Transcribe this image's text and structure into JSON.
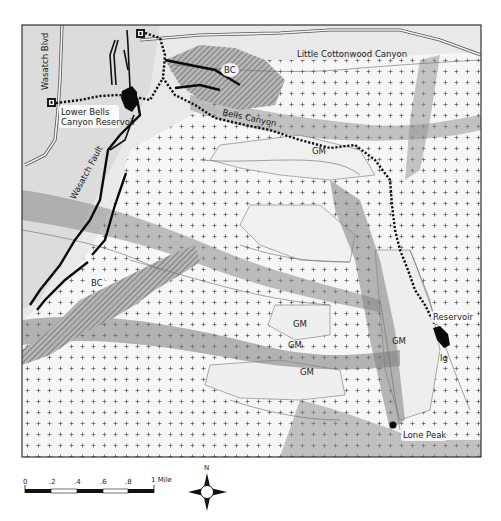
{
  "map": {
    "frame": {
      "x": 22,
      "y": 25,
      "width": 459,
      "height": 432
    },
    "colors": {
      "frame": "#333333",
      "hillshade_light": "#f2f2f2",
      "hillshade_mid": "#c8c8c8",
      "hillshade_dark": "#7a7a7a",
      "trail": "#111111",
      "fault": "#0a0a0a",
      "water": "#0a0a0a",
      "road": "#555555",
      "contact": "#666666",
      "hatch": "#444444"
    },
    "labels": {
      "wasatch_blvd": "Wasatch Blvd",
      "lower_reservoir_line1": "Lower Bells",
      "lower_reservoir_line2": "Canyon Reservoir",
      "little_cottonwood": "Little Cottonwood Canyon",
      "bells_canyon": "Bells Canyon",
      "wasatch_fault": "Wasatch Fault",
      "reservoir": "Reservoir",
      "lone_peak": "Lone Peak",
      "bc_north": "BC",
      "bc_south": "BC",
      "gm_1": "GM",
      "gm_2": "GM",
      "gm_3": "GM",
      "gm_4": "GM",
      "gm_5": "GM",
      "ig": "Ig"
    },
    "trailhead_icons": [
      {
        "name": "trailhead-north",
        "x": 141,
        "y": 34
      },
      {
        "name": "trailhead-west",
        "x": 51,
        "y": 103
      }
    ]
  },
  "scale_bar": {
    "ticks": [
      "0",
      ".2",
      ".4",
      ".6",
      ".8",
      "1 Mile"
    ],
    "unit": "Mile"
  },
  "north_arrow": {
    "label": "N"
  },
  "caption": {
    "text": "Geologic map of Bells Canyon area"
  }
}
